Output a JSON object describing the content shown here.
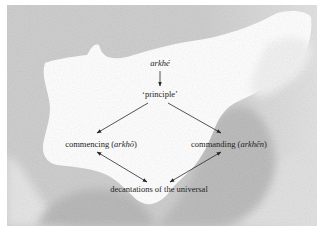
{
  "diagram": {
    "colors": {
      "background_gray": "#c8c8c8",
      "light_gray": "#e4e4e4",
      "cloud_white": "#ffffff",
      "text": "#1e1e1e",
      "arrow": "#2a2a2a"
    },
    "nodes": {
      "root": {
        "text": "arkhé",
        "style": "italic"
      },
      "principle": {
        "text": "‘principle’"
      },
      "commencing": {
        "prefix": "commencing (",
        "term": "arkhô",
        "suffix": ")"
      },
      "commanding": {
        "prefix": "commanding (",
        "term": "arkhên",
        "suffix": ")"
      },
      "decantations": {
        "text": "decantations of the universal"
      }
    },
    "edges": [
      {
        "from": "root",
        "to": "principle",
        "type": "single-arrow"
      },
      {
        "from": "principle",
        "to": "commencing",
        "type": "single-arrow"
      },
      {
        "from": "principle",
        "to": "commanding",
        "type": "single-arrow"
      },
      {
        "from": "commencing",
        "to": "decantations",
        "type": "double-arrow"
      },
      {
        "from": "commanding",
        "to": "decantations",
        "type": "double-arrow"
      }
    ]
  }
}
